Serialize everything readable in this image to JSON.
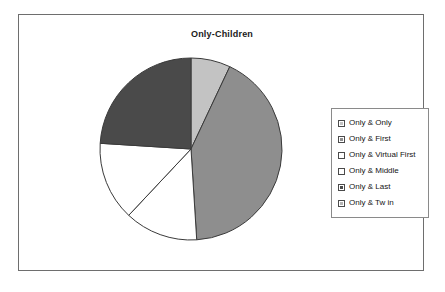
{
  "chart_title": "Only-Children",
  "legend": {
    "items": [
      {
        "label": "Only & Only",
        "color": "#c3c3c3"
      },
      {
        "label": "Only & First",
        "color": "#8e8e8e"
      },
      {
        "label": "Only & Virtual First",
        "color": "#ffffff"
      },
      {
        "label": "Only & Middle",
        "color": "#ffffff"
      },
      {
        "label": "Only & Last",
        "color": "#4a4a4a"
      },
      {
        "label": "Only & Tw in",
        "color": "#b5b5b5"
      }
    ]
  },
  "chart_data": {
    "type": "pie",
    "title": "Only-Children",
    "xlabel": "",
    "ylabel": "",
    "legend_position": "right",
    "grid": false,
    "start_angle_deg": 0,
    "direction": "clockwise",
    "categories": [
      "Only & Only",
      "Only & First",
      "Only & Virtual First",
      "Only & Middle",
      "Only & Last",
      "Only & Tw in"
    ],
    "values": [
      7,
      42,
      13,
      14,
      24,
      0
    ],
    "colors": [
      "#c3c3c3",
      "#8e8e8e",
      "#ffffff",
      "#ffffff",
      "#4a4a4a",
      "#b5b5b5"
    ],
    "slice_outline_color": "#3a3a3a"
  }
}
